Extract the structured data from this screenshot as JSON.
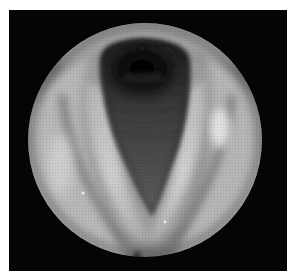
{
  "image": {
    "subject": "laryngoscopic view of the larynx",
    "description": "Grayscale endoscopic circular view showing the vocal folds forming a V-shaped glottis opening into the dark tracheal airway with visible tracheal rings",
    "view": "circular endoscope field on black background",
    "palette": {
      "background": "#ffffff",
      "frame": "#050505",
      "tissue_light": "#c9c9c9",
      "tissue_mid": "#8f8f8f",
      "tissue_dark": "#4a4a4a",
      "airway": "#0a0a0a"
    },
    "regions": [
      {
        "name": "endoscope-field",
        "shape": "circle",
        "cx": 145,
        "cy": 140,
        "r": 117
      },
      {
        "name": "tracheal-lumen",
        "shape": "dark ellipse",
        "cx": 142,
        "cy": 72
      },
      {
        "name": "glottis",
        "shape": "inverted teardrop opening",
        "apex_x": 152,
        "apex_y": 212
      },
      {
        "name": "left-vocal-fold",
        "side": "left"
      },
      {
        "name": "right-vocal-fold",
        "side": "right"
      },
      {
        "name": "anterior-commissure",
        "x": 140,
        "y": 252
      }
    ]
  }
}
